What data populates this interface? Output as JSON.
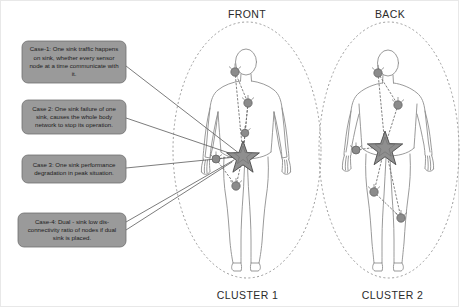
{
  "diagram": {
    "title_front": "FRONT",
    "title_back": "BACK",
    "cluster_left": "CLUSTER 1",
    "cluster_right": "CLUSTER 2",
    "colors": {
      "callout_fill": "#9a9a9a",
      "callout_stroke": "#6f6f6f",
      "node_fill": "#8b8b8b",
      "node_stroke": "#5c5c5c",
      "sink_fill": "#8f8f8f",
      "sink_stroke": "#4a4a4a",
      "body_stroke": "#8e8e8e",
      "ellipse_stroke": "#9b9b9b",
      "link_stroke": "#6b6b6b",
      "leader_stroke": "#5a5a5a",
      "text": "#1c1c1c",
      "caption_text": "#2b2b2b",
      "frame": "#e8e8e8",
      "background": "#ffffff"
    }
  },
  "callouts": [
    {
      "id": "case-1",
      "text": "Case-1: One sink traffic happens on sink, whether every sensor node at a time communicate with it.",
      "box": {
        "x": 22,
        "y": 41,
        "w": 104,
        "h": 42
      }
    },
    {
      "id": "case-2",
      "text": "Case 2: One sink failure of one sink, causes the whole body network to stop its operation.",
      "box": {
        "x": 22,
        "y": 100,
        "w": 104,
        "h": 34
      }
    },
    {
      "id": "case-3",
      "text": "Case 3: One sink performance degradation in peak situation.",
      "box": {
        "x": 22,
        "y": 155,
        "w": 104,
        "h": 28
      }
    },
    {
      "id": "case-4",
      "text": "Case-4: Dual - sink low dis-connectivity ratio of nodes if dual sink is placed.",
      "box": {
        "x": 18,
        "y": 213,
        "w": 108,
        "h": 34
      }
    }
  ],
  "clusters": [
    {
      "name": "CLUSTER 1",
      "view": "FRONT",
      "sink": {
        "x": 243,
        "y": 155,
        "r": 13
      },
      "nodes": [
        {
          "id": "front-head-node",
          "x": 235,
          "y": 72,
          "r": 4.2
        },
        {
          "id": "front-chest-node",
          "x": 248,
          "y": 103,
          "r": 4.2
        },
        {
          "id": "front-abdomen-node",
          "x": 245,
          "y": 133,
          "r": 3.8
        },
        {
          "id": "front-left-wrist-node",
          "x": 216,
          "y": 159,
          "r": 4.0
        },
        {
          "id": "front-thigh-node",
          "x": 236,
          "y": 186,
          "r": 4.2
        }
      ]
    },
    {
      "name": "CLUSTER 2",
      "view": "BACK",
      "sink": {
        "x": 385,
        "y": 146,
        "r": 14
      },
      "nodes": [
        {
          "id": "back-head-node",
          "x": 378,
          "y": 73,
          "r": 4.2
        },
        {
          "id": "back-shoulder-node",
          "x": 398,
          "y": 105,
          "r": 4.2
        },
        {
          "id": "back-wrist-node",
          "x": 356,
          "y": 150,
          "r": 4.0
        },
        {
          "id": "back-left-leg-node",
          "x": 374,
          "y": 192,
          "r": 4.2
        },
        {
          "id": "back-right-leg-node",
          "x": 401,
          "y": 218,
          "r": 4.2
        }
      ]
    }
  ]
}
